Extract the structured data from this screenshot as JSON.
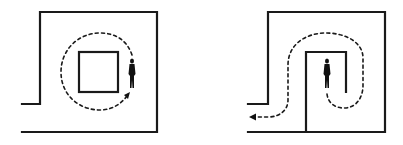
{
  "diagram": {
    "panels": [
      {
        "id": "left",
        "description": "Room with central square obstacle; person walks a closed dashed circular path around the square",
        "elements": [
          "outer-wall",
          "entrance-gap",
          "inner-square",
          "dashed-circular-path",
          "person-figure",
          "arrowhead"
        ]
      },
      {
        "id": "right",
        "description": "Room with U-shaped inner wall; person walks a dashed S-shaped path out through the entrance",
        "elements": [
          "outer-wall",
          "entrance-gap",
          "inner-u-wall",
          "dashed-s-path",
          "person-figure",
          "exit-arrowhead"
        ]
      }
    ],
    "colors": {
      "line": "#1a1a1a",
      "background": "#ffffff"
    }
  }
}
